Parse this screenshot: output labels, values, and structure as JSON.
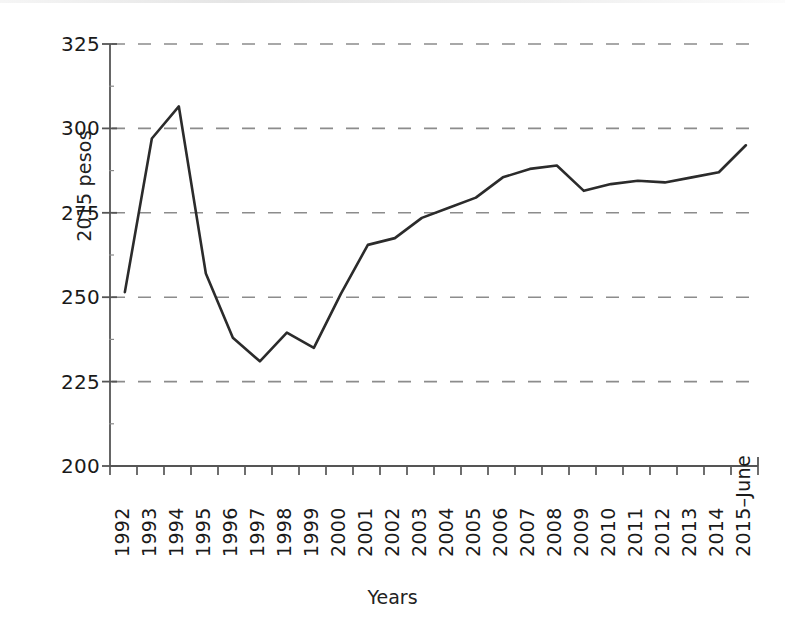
{
  "chart_data": {
    "type": "line",
    "title": "",
    "xlabel": "Years",
    "ylabel": "2015 pesos",
    "ylim": [
      200,
      325
    ],
    "yticks": [
      200,
      225,
      250,
      275,
      300,
      325
    ],
    "grid": "horizontal-dashed",
    "legend": "none",
    "line_color": "#2b2b2b",
    "categories": [
      "1992",
      "1993",
      "1994",
      "1995",
      "1996",
      "1997",
      "1998",
      "1999",
      "2000",
      "2001",
      "2002",
      "2003",
      "2004",
      "2005",
      "2006",
      "2007",
      "2008",
      "2009",
      "2010",
      "2011",
      "2012",
      "2013",
      "2014",
      "2015–June"
    ],
    "values": [
      251.5,
      297.0,
      306.5,
      257.0,
      238.0,
      231.0,
      239.5,
      235.0,
      251.0,
      265.5,
      267.5,
      273.5,
      276.5,
      279.5,
      285.5,
      288.0,
      289.0,
      281.5,
      283.5,
      284.5,
      284.0,
      285.5,
      287.0,
      295.0
    ],
    "series": [
      {
        "name": "2015 pesos",
        "values": [
          251.5,
          297.0,
          306.5,
          257.0,
          238.0,
          231.0,
          239.5,
          235.0,
          251.0,
          265.5,
          267.5,
          273.5,
          276.5,
          279.5,
          285.5,
          288.0,
          289.0,
          281.5,
          283.5,
          284.5,
          284.0,
          285.5,
          287.0,
          295.0
        ]
      }
    ]
  }
}
